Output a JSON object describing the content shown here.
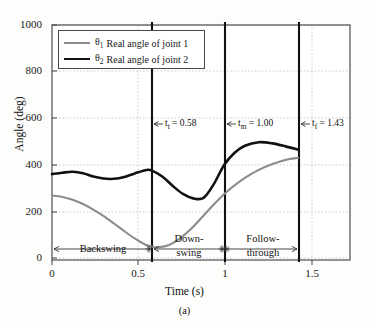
{
  "figure": {
    "caption": "(a)",
    "xlabel": "Time (s)",
    "ylabel": "Angle (deg)"
  },
  "legend": {
    "items": [
      {
        "symbol": "θ",
        "sub": "1",
        "label": "Real angle of joint 1",
        "color": "#8c8c8c"
      },
      {
        "symbol": "θ",
        "sub": "2",
        "label": "Real angle of joint 2",
        "color": "#111111"
      }
    ]
  },
  "axes": {
    "yticks": [
      "1000",
      "800",
      "600",
      "400",
      "200",
      "0"
    ],
    "xticks": [
      "0",
      "0.5",
      "1",
      "1.5"
    ]
  },
  "markers": [
    {
      "name": "t-top",
      "symbol": "t",
      "sub": "t",
      "value": "0.58",
      "text": "tₜ = 0.58",
      "prefix": "t",
      "eq": " = 0.58"
    },
    {
      "name": "t-mid",
      "symbol": "t",
      "sub": "m",
      "value": "1.00",
      "text": "tₘ = 1.00",
      "prefix": "t",
      "eq": " = 1.00"
    },
    {
      "name": "t-final",
      "symbol": "t",
      "sub": "f",
      "value": "1.43",
      "text": "tᶠ = 1.43",
      "prefix": "t",
      "eq": " = 1.43"
    }
  ],
  "phases": [
    {
      "name": "backswing",
      "line1": "Backswing",
      "line2": ""
    },
    {
      "name": "downswing",
      "line1": "Down-",
      "line2": "swing"
    },
    {
      "name": "follow-through",
      "line1": "Follow-",
      "line2": "through"
    }
  ],
  "chart_data": {
    "type": "line",
    "title": "",
    "xlabel": "Time (s)",
    "ylabel": "Angle (deg)",
    "xlim": [
      0,
      1.73
    ],
    "ylim": [
      -280,
      1000
    ],
    "yticks": [
      0,
      200,
      400,
      600,
      800,
      1000
    ],
    "xticks": [
      0,
      0.5,
      1,
      1.5
    ],
    "grid": true,
    "legend_position": "upper-left",
    "vlines": [
      {
        "x": 0.58,
        "label": "t_t = 0.58"
      },
      {
        "x": 1.0,
        "label": "t_m = 1.00"
      },
      {
        "x": 1.43,
        "label": "t_f = 1.43"
      }
    ],
    "phase_spans": [
      {
        "label": "Backswing",
        "from": 0.0,
        "to": 0.58
      },
      {
        "label": "Down-swing",
        "from": 0.58,
        "to": 1.0
      },
      {
        "label": "Follow-through",
        "from": 1.0,
        "to": 1.43
      }
    ],
    "series": [
      {
        "name": "θ₁ Real angle of joint 1",
        "color": "#8c8c8c",
        "x": [
          0.0,
          0.06,
          0.12,
          0.18,
          0.24,
          0.3,
          0.36,
          0.42,
          0.48,
          0.54,
          0.58,
          0.62,
          0.68,
          0.74,
          0.8,
          0.86,
          0.92,
          1.0,
          1.06,
          1.12,
          1.2,
          1.28,
          1.36,
          1.43
        ],
        "y": [
          268,
          262,
          250,
          232,
          208,
          180,
          148,
          115,
          84,
          58,
          48,
          46,
          56,
          82,
          120,
          166,
          215,
          275,
          312,
          344,
          378,
          403,
          422,
          430
        ]
      },
      {
        "name": "θ₂ Real angle of joint 2",
        "color": "#111111",
        "x": [
          0.0,
          0.06,
          0.12,
          0.18,
          0.24,
          0.3,
          0.36,
          0.42,
          0.48,
          0.55,
          0.58,
          0.64,
          0.7,
          0.76,
          0.82,
          0.88,
          0.94,
          1.0,
          1.06,
          1.12,
          1.2,
          1.28,
          1.36,
          1.43
        ],
        "y": [
          360,
          366,
          370,
          364,
          350,
          341,
          340,
          348,
          363,
          378,
          375,
          350,
          310,
          275,
          256,
          258,
          318,
          400,
          452,
          482,
          497,
          492,
          478,
          465
        ]
      }
    ]
  }
}
